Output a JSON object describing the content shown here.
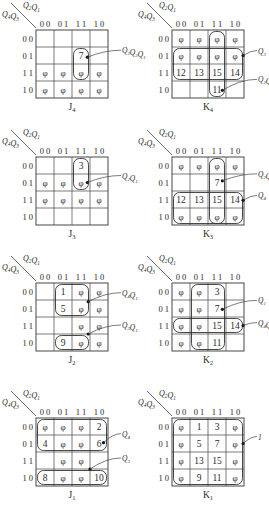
{
  "header": {
    "row_var_label": "Q4Q3",
    "col_var_label": "Q2Q1",
    "col_codes": [
      "0 0",
      "0 1",
      "1 1",
      "1 0"
    ],
    "row_codes": [
      "0 0",
      "0 1",
      "1 1",
      "1 0"
    ]
  },
  "maps": [
    {
      "id": "J4",
      "title": "J",
      "sub": "4",
      "cells": [
        [
          "",
          "",
          "",
          ""
        ],
        [
          "",
          "",
          "7",
          ""
        ],
        [
          "φ",
          "φ",
          "φ",
          "φ"
        ],
        [
          "φ",
          "φ",
          "φ",
          "φ"
        ]
      ],
      "loops": [
        {
          "r0": 1,
          "c0": 2,
          "r1": 2,
          "c1": 2
        }
      ],
      "annotations": [
        {
          "text": "Q3Q2Q1",
          "anchor_row": 1.6,
          "anchor_col": 2.85,
          "label_dy": -4
        }
      ]
    },
    {
      "id": "K4",
      "title": "K",
      "sub": "4",
      "cells": [
        [
          "φ",
          "φ",
          "φ",
          "φ"
        ],
        [
          "φ",
          "φ",
          "φ",
          "φ"
        ],
        [
          "12",
          "13",
          "15",
          "14"
        ],
        [
          "",
          "",
          "11",
          ""
        ]
      ],
      "loops": [
        {
          "r0": 0,
          "c0": 2,
          "r1": 3,
          "c1": 2
        },
        {
          "r0": 1,
          "c0": 0,
          "r1": 2,
          "c1": 3
        }
      ],
      "annotations": [
        {
          "text": "Q3",
          "anchor_row": 1.5,
          "anchor_col": 3.95,
          "label_dy": -2
        },
        {
          "text": "Q2Q1",
          "anchor_row": 3.55,
          "anchor_col": 2.8,
          "label_dy": -8
        }
      ]
    },
    {
      "id": "J3",
      "title": "J",
      "sub": "3",
      "cells": [
        [
          "",
          "",
          "3",
          ""
        ],
        [
          "φ",
          "φ",
          "φ",
          "φ"
        ],
        [
          "φ",
          "φ",
          "φ",
          "φ"
        ],
        [
          "",
          "",
          "",
          ""
        ]
      ],
      "loops": [
        {
          "r0": 0,
          "c0": 2,
          "r1": 1,
          "c1": 2
        }
      ],
      "annotations": [
        {
          "text": "Q2Q1",
          "anchor_row": 1.5,
          "anchor_col": 2.85,
          "label_dy": -4
        }
      ]
    },
    {
      "id": "K3",
      "title": "K",
      "sub": "3",
      "cells": [
        [
          "φ",
          "φ",
          "φ",
          "φ"
        ],
        [
          "",
          "",
          "7",
          ""
        ],
        [
          "12",
          "13",
          "15",
          "14"
        ],
        [
          "φ",
          "φ",
          "φ",
          "φ"
        ]
      ],
      "loops": [
        {
          "r0": 0,
          "c0": 2,
          "r1": 3,
          "c1": 2
        },
        {
          "r0": 2,
          "c0": 0,
          "r1": 3,
          "c1": 3
        }
      ],
      "annotations": [
        {
          "text": "Q2Q1",
          "anchor_row": 1.4,
          "anchor_col": 2.8,
          "label_dy": -4
        },
        {
          "text": "Q4",
          "anchor_row": 2.55,
          "anchor_col": 3.95,
          "label_dy": -2
        }
      ]
    },
    {
      "id": "J2",
      "title": "J",
      "sub": "2",
      "cells": [
        [
          "",
          "1",
          "φ",
          "φ"
        ],
        [
          "",
          "5",
          "φ",
          "φ"
        ],
        [
          "",
          "",
          "φ",
          "φ"
        ],
        [
          "",
          "9",
          "φ",
          "φ"
        ]
      ],
      "loops": [
        {
          "r0": 0,
          "c0": 1,
          "r1": 1,
          "c1": 2
        },
        {
          "r0": 3,
          "c0": 1,
          "r1": 3,
          "c1": 2,
          "open": "top"
        }
      ],
      "annotations": [
        {
          "text": "Q4Q1",
          "anchor_row": 1.1,
          "anchor_col": 2.9,
          "label_dy": -6
        },
        {
          "text": "Q3Q1",
          "anchor_row": 3.0,
          "anchor_col": 2.9,
          "label_dy": -6
        }
      ]
    },
    {
      "id": "K2",
      "title": "K",
      "sub": "2",
      "cells": [
        [
          "φ",
          "φ",
          "3",
          ""
        ],
        [
          "φ",
          "φ",
          "7",
          ""
        ],
        [
          "φ",
          "φ",
          "15",
          "14"
        ],
        [
          "φ",
          "φ",
          "11",
          ""
        ]
      ],
      "loops": [
        {
          "r0": 0,
          "c0": 1,
          "r1": 3,
          "c1": 2
        },
        {
          "r0": 2,
          "c0": 0,
          "r1": 2,
          "c1": 3
        }
      ],
      "annotations": [
        {
          "text": "Q1",
          "anchor_row": 1.55,
          "anchor_col": 2.8,
          "label_dy": -6
        },
        {
          "text": "Q4Q3",
          "anchor_row": 2.5,
          "anchor_col": 3.95,
          "label_dy": 0
        }
      ]
    },
    {
      "id": "J1",
      "title": "J",
      "sub": "1",
      "cells": [
        [
          "φ",
          "φ",
          "φ",
          "2"
        ],
        [
          "4",
          "φ",
          "φ",
          "6"
        ],
        [
          "",
          "φ",
          "φ",
          ""
        ],
        [
          "8",
          "φ",
          "φ",
          "10"
        ]
      ],
      "loops": [
        {
          "r0": 0,
          "c0": 0,
          "r1": 1,
          "c1": 3
        },
        {
          "r0": 3,
          "c0": 0,
          "r1": 3,
          "c1": 3
        }
      ],
      "annotations": [
        {
          "text": "Q4",
          "anchor_row": 1.45,
          "anchor_col": 3.75,
          "label_dy": -6
        },
        {
          "text": "Q3",
          "anchor_row": 3.0,
          "anchor_col": 3.0,
          "label_dy": -8
        }
      ]
    },
    {
      "id": "K1",
      "title": "K",
      "sub": "1",
      "cells": [
        [
          "φ",
          "1",
          "3",
          "φ"
        ],
        [
          "φ",
          "5",
          "7",
          "φ"
        ],
        [
          "φ",
          "13",
          "15",
          "φ"
        ],
        [
          "φ",
          "9",
          "11",
          "φ"
        ]
      ],
      "loops": [
        {
          "r0": 0,
          "c0": 0,
          "r1": 3,
          "c1": 3
        }
      ],
      "annotations": [
        {
          "text": "1",
          "anchor_row": 1.5,
          "anchor_col": 3.95,
          "label_dy": -4
        }
      ]
    }
  ]
}
